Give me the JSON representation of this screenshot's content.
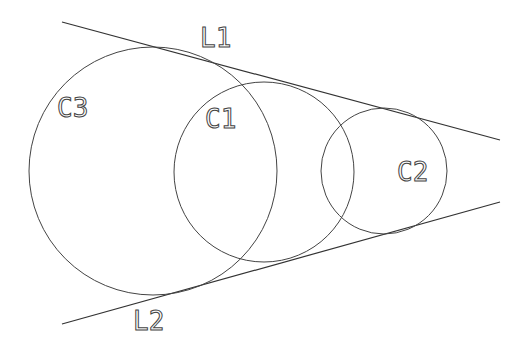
{
  "diagram": {
    "lines": [
      {
        "label": "L1",
        "x1": 62,
        "y1": 22,
        "x2": 500,
        "y2": 140,
        "label_x": 200,
        "label_y": 47
      },
      {
        "label": "L2",
        "x1": 62,
        "y1": 324,
        "x2": 500,
        "y2": 202,
        "label_x": 133,
        "label_y": 330
      }
    ],
    "circles": [
      {
        "label": "C3",
        "cx": 153,
        "cy": 171,
        "r": 124,
        "label_x": 57,
        "label_y": 117
      },
      {
        "label": "C1",
        "cx": 264,
        "cy": 172,
        "r": 90,
        "label_x": 205,
        "label_y": 128
      },
      {
        "label": "C2",
        "cx": 384,
        "cy": 171,
        "r": 63,
        "label_x": 397,
        "label_y": 181
      }
    ],
    "stroke_color": "#333333",
    "background": "#ffffff"
  }
}
